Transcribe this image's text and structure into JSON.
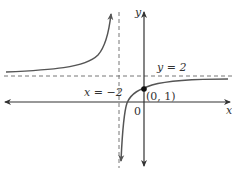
{
  "graph": {
    "function_description": "rational function y = (2x+2)/(x+2) with asymptotes",
    "axes": {
      "x_label": "x",
      "y_label": "y",
      "origin_label": "0"
    },
    "asymptotes": {
      "vertical_label": "x = −2",
      "horizontal_label": "y = 2"
    },
    "point": {
      "label": "(0, 1)"
    },
    "colors": {
      "curve": "#555555",
      "axis": "#333333",
      "asymptote": "#777777",
      "point": "#111111"
    }
  }
}
